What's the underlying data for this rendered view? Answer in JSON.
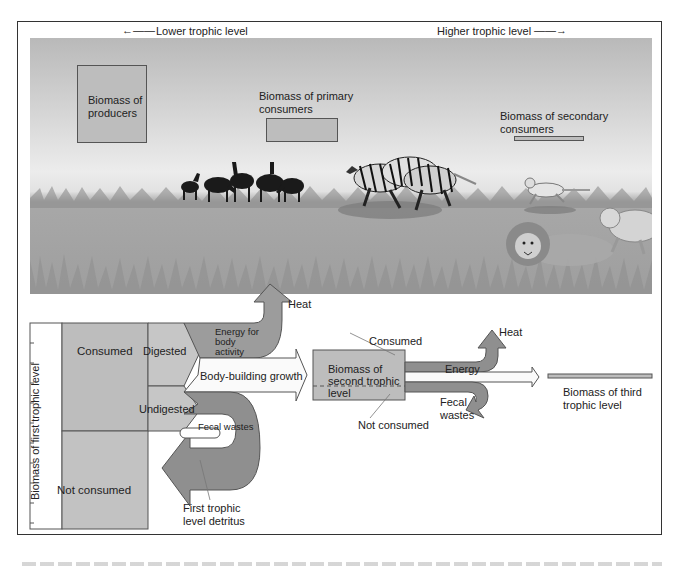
{
  "header": {
    "lower_label": "Lower trophic level",
    "higher_label": "Higher trophic level"
  },
  "scene": {
    "producers_label": "Biomass of producers",
    "primary_label": "Biomass of primary consumers",
    "secondary_label": "Biomass of secondary consumers",
    "animals": [
      "antelope-herd",
      "zebras",
      "cheetah",
      "lions"
    ]
  },
  "flow": {
    "axis_label": "Biomass of first trophic level",
    "consumed": "Consumed",
    "not_consumed": "Not consumed",
    "digested": "Digested",
    "undigested": "Undigested",
    "energy_body_activity": "Energy for body activity",
    "heat": "Heat",
    "body_building": "Body-building growth",
    "fecal_wastes": "Fecal wastes",
    "detritus": "First trophic level detritus",
    "second_level": {
      "consumed": "Consumed",
      "biomass": "Biomass of second trophic level",
      "not_consumed": "Not consumed",
      "energy": "Energy",
      "heat": "Heat",
      "fecal_wastes": "Fecal wastes"
    },
    "third_level": "Biomass of third trophic level"
  },
  "colors": {
    "box_fill": "#bdbdbd",
    "dark_arrow": "#8f8f8f",
    "medium_arrow": "#a9a9a9",
    "outline": "#555555"
  }
}
